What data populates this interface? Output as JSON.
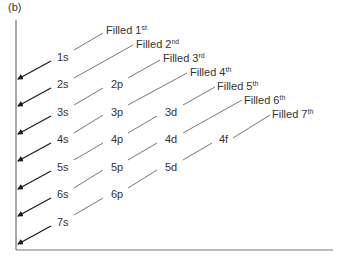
{
  "figure": {
    "panel_label": "(b)"
  },
  "orbital_rows": [
    {
      "n": 1,
      "orbitals": [
        "1s"
      ]
    },
    {
      "n": 2,
      "orbitals": [
        "2s",
        "2p"
      ]
    },
    {
      "n": 3,
      "orbitals": [
        "3s",
        "3p",
        "3d"
      ]
    },
    {
      "n": 4,
      "orbitals": [
        "4s",
        "4p",
        "4d",
        "4f"
      ]
    },
    {
      "n": 5,
      "orbitals": [
        "5s",
        "5p",
        "5d"
      ]
    },
    {
      "n": 6,
      "orbitals": [
        "6s",
        "6p"
      ]
    },
    {
      "n": 7,
      "orbitals": [
        "7s"
      ]
    }
  ],
  "labels": {
    "o_1s": "1s",
    "o_2s": "2s",
    "o_2p": "2p",
    "o_3s": "3s",
    "o_3p": "3p",
    "o_3d": "3d",
    "o_4s": "4s",
    "o_4p": "4p",
    "o_4d": "4d",
    "o_4f": "4f",
    "o_5s": "5s",
    "o_5p": "5p",
    "o_5d": "5d",
    "o_6s": "6s",
    "o_6p": "6p",
    "o_7s": "7s"
  },
  "fill_order": [
    {
      "text": "Filled 1",
      "sup": "st"
    },
    {
      "text": "Filled 2",
      "sup": "nd"
    },
    {
      "text": "Filled 3",
      "sup": "rd"
    },
    {
      "text": "Filled 4",
      "sup": "th"
    },
    {
      "text": "Filled 5",
      "sup": "th"
    },
    {
      "text": "Filled 6",
      "sup": "th"
    },
    {
      "text": "Filled 7",
      "sup": "th"
    }
  ],
  "colors": {
    "axis": "#555555",
    "arrow": "#1a1a1a",
    "diagonal": "#555555",
    "text": "#333333"
  }
}
